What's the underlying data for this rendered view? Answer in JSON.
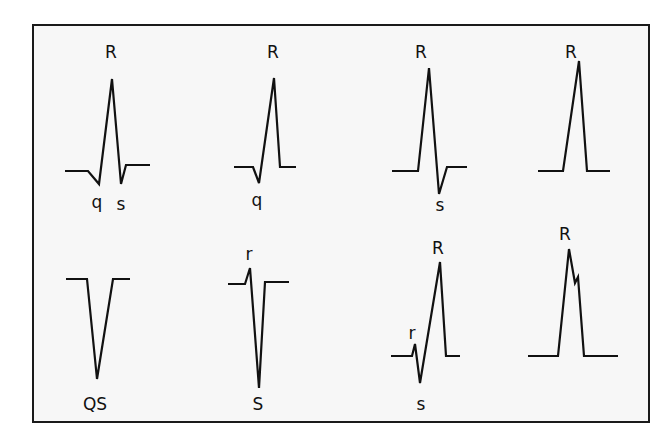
{
  "figure": {
    "stroke_color": "#111111",
    "background": "#f7f7f7"
  },
  "complexes": [
    {
      "id": "qRs",
      "labels": {
        "top": "R",
        "q": "q",
        "s": "s"
      }
    },
    {
      "id": "qR",
      "labels": {
        "top": "R",
        "q": "q"
      }
    },
    {
      "id": "Rs",
      "labels": {
        "top": "R",
        "s": "s"
      }
    },
    {
      "id": "R",
      "labels": {
        "top": "R"
      }
    },
    {
      "id": "QS",
      "labels": {
        "bottom": "QS"
      }
    },
    {
      "id": "rS",
      "labels": {
        "r": "r",
        "bottom": "S"
      }
    },
    {
      "id": "rsR",
      "labels": {
        "top": "R",
        "r": "r",
        "s": "s"
      }
    },
    {
      "id": "notched-R",
      "labels": {
        "top": "R"
      }
    }
  ]
}
